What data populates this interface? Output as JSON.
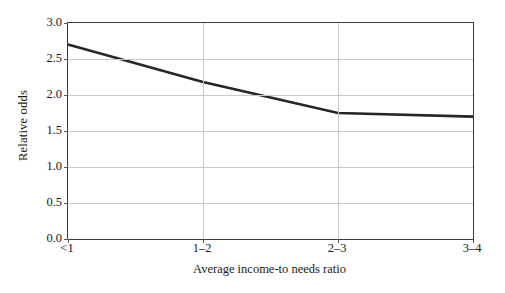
{
  "chart_data": {
    "type": "line",
    "title": "",
    "xlabel": "Average income-to needs ratio",
    "ylabel": "Relative odds",
    "categories": [
      "<1",
      "1–2",
      "2–3",
      "3–4"
    ],
    "values": [
      2.7,
      2.18,
      1.75,
      1.7
    ],
    "series": [
      {
        "name": "Relative odds",
        "values": [
          2.7,
          2.18,
          1.75,
          1.7
        ]
      }
    ],
    "ylim": [
      0.0,
      3.0
    ],
    "yticks": [
      "0.0",
      "0.5",
      "1.0",
      "1.5",
      "2.0",
      "2.5",
      "3.0"
    ],
    "ytick_values": [
      0.0,
      0.5,
      1.0,
      1.5,
      2.0,
      2.5,
      3.0
    ],
    "grid": "horizontal-and-vertical",
    "legend": "none",
    "line_color": "#262626",
    "grid_color": "#c9c9c9",
    "axis_color": "#3a3a3a",
    "background_color": "#ffffff"
  }
}
